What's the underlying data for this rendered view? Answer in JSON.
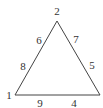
{
  "diagram": {
    "type": "triangle-labeling",
    "stroke_color": "#444444",
    "text_color": "#333333",
    "vertices": [
      {
        "label": "2",
        "position": "top"
      },
      {
        "label": "1",
        "position": "bottom-left"
      },
      {
        "label": "",
        "position": "bottom-right"
      }
    ],
    "edge_labels": {
      "left": [
        "6",
        "8"
      ],
      "right": [
        "7",
        "5"
      ],
      "bottom": [
        "9",
        "4"
      ]
    }
  }
}
